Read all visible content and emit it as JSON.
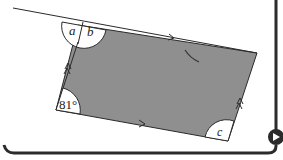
{
  "figure": {
    "type": "geometry-diagram",
    "labels": {
      "angle_a": "a",
      "angle_b": "b",
      "angle_c": "c",
      "angle_bottom_left": "81°"
    },
    "colors": {
      "shape_fill": "#8f8f8f",
      "stroke": "#2a2a2a",
      "frame": "#2b2b2b",
      "background": "#ffffff"
    }
  },
  "navigation": {
    "next_icon": "arrow-right-circle-icon"
  }
}
